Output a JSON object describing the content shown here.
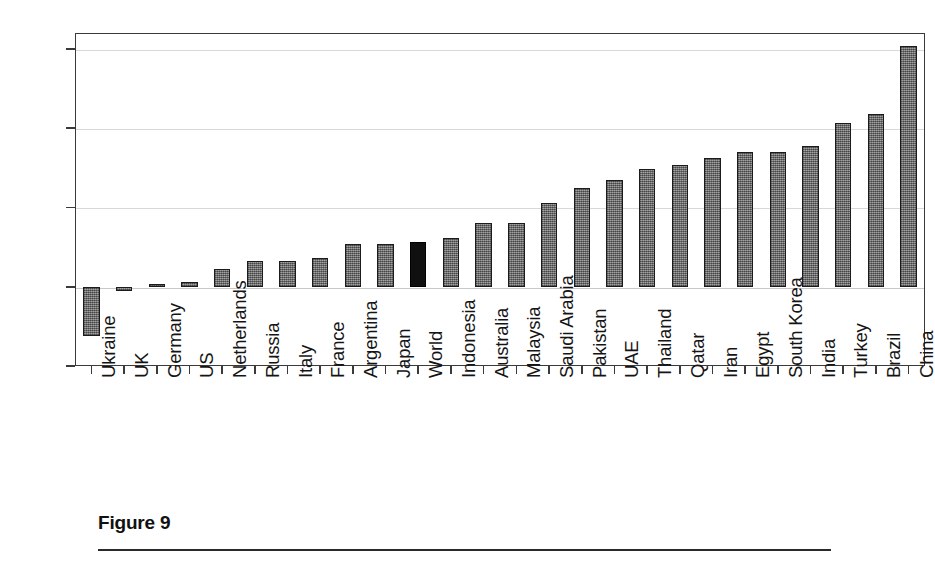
{
  "caption": {
    "title": "Figure 9"
  },
  "chart_data": {
    "type": "bar",
    "title": "",
    "subtitle": "",
    "xlabel": "",
    "ylabel": "",
    "ylim": [
      -5,
      16
    ],
    "ytick_values": [
      15,
      10,
      5,
      0,
      -5
    ],
    "ytick_labels": [
      "15%",
      "10%",
      "5%",
      "0%",
      "−5%"
    ],
    "grid": true,
    "legend": "none",
    "value_unit": "percent",
    "highlight_category": "World",
    "highlight_color": "#101010",
    "bar_color": "#808080",
    "bar_edge_color": "#1b1b1b",
    "categories": [
      "Ukraine",
      "UK",
      "Germany",
      "US",
      "Netherlands",
      "Russia",
      "Italy",
      "France",
      "Argentina",
      "Japan",
      "World",
      "Indonesia",
      "Australia",
      "Malaysia",
      "Saudi Arabia",
      "Pakistan",
      "UAE",
      "Thailand",
      "Qatar",
      "Iran",
      "Egypt",
      "South Korea",
      "India",
      "Turkey",
      "Brazil",
      "China"
    ],
    "values": [
      -3.1,
      -0.3,
      0.2,
      0.3,
      1.1,
      1.6,
      1.6,
      1.8,
      2.7,
      2.7,
      2.8,
      3.1,
      4.0,
      4.0,
      5.3,
      6.2,
      6.7,
      7.4,
      7.7,
      8.1,
      8.5,
      8.5,
      8.9,
      10.3,
      10.9,
      15.2
    ]
  }
}
